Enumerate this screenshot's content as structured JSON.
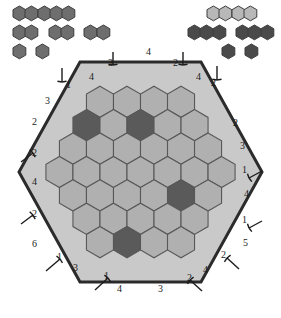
{
  "app": {
    "title": "Hexagon Logic Puzzle",
    "board_shape": "hexagon",
    "rows": 7
  },
  "colors": {
    "background": "#ffffff",
    "board_fill": "#c9c9c9",
    "board_border": "#2b2b2b",
    "cell_empty": "#b0b0b0",
    "cell_filled": "#5a5a5a",
    "cell_stroke": "#585858",
    "palette_light": "#b8b8b8",
    "palette_medium": "#6e6e6e",
    "palette_dark": "#4a4a4a",
    "clue_text": "#1c1c1c",
    "arrow": "#1c1c1c"
  },
  "palette": {
    "left": {
      "name": "left-piece-tray",
      "rows": [
        {
          "groups": [
            {
              "count": 5,
              "tone": "medium"
            }
          ]
        },
        {
          "groups": [
            {
              "count": 2,
              "tone": "medium"
            },
            {
              "count": 2,
              "tone": "medium"
            },
            {
              "count": 2,
              "tone": "medium"
            }
          ]
        },
        {
          "groups": [
            {
              "count": 1,
              "tone": "medium"
            },
            {
              "count": 1,
              "tone": "medium"
            }
          ]
        }
      ]
    },
    "right": {
      "name": "right-piece-tray",
      "rows": [
        {
          "groups": [
            {
              "count": 4,
              "tone": "light"
            }
          ]
        },
        {
          "groups": [
            {
              "count": 3,
              "tone": "dark"
            },
            {
              "count": 3,
              "tone": "dark"
            }
          ]
        },
        {
          "groups": [
            {
              "count": 1,
              "tone": "dark"
            },
            {
              "count": 1,
              "tone": "dark"
            }
          ]
        }
      ]
    }
  },
  "board": {
    "name": "hex-board",
    "row_lengths": [
      4,
      5,
      6,
      7,
      6,
      5,
      4
    ],
    "filled_cells": [
      {
        "row": 1,
        "col": 2,
        "label": "filled-cell-r1c2"
      },
      {
        "row": 1,
        "col": 0,
        "label": "filled-cell-r1c0"
      },
      {
        "row": 4,
        "col": 4,
        "label": "filled-cell-r4c4"
      },
      {
        "row": 6,
        "col": 1,
        "label": "filled-cell-r6c1"
      }
    ]
  },
  "clues": {
    "top": [
      {
        "text": "4",
        "arrow": "none"
      },
      {
        "text": "3",
        "arrow": "down"
      },
      {
        "text": "2",
        "arrow": "down"
      },
      {
        "text": "1",
        "arrow": "down"
      },
      {
        "text": "4",
        "arrow": "none"
      },
      {
        "text": "4",
        "arrow": "none"
      },
      {
        "text": "2",
        "arrow": "down"
      }
    ],
    "upper_left": [
      {
        "text": "3",
        "arrow": "none"
      },
      {
        "text": "2",
        "arrow": "none"
      }
    ],
    "left": [
      {
        "text": "2",
        "arrow": "up-right"
      },
      {
        "text": "4",
        "arrow": "none"
      },
      {
        "text": "2",
        "arrow": "up-right"
      },
      {
        "text": "6",
        "arrow": "none"
      }
    ],
    "upper_right": [
      {
        "text": "2",
        "arrow": "none"
      },
      {
        "text": "3",
        "arrow": "none"
      }
    ],
    "right": [
      {
        "text": "1",
        "arrow": "left"
      },
      {
        "text": "4",
        "arrow": "none"
      },
      {
        "text": "1",
        "arrow": "left"
      },
      {
        "text": "5",
        "arrow": "none"
      }
    ],
    "bottom_left": [
      {
        "text": "1",
        "arrow": "up-right"
      },
      {
        "text": "3",
        "arrow": "none"
      }
    ],
    "bottom": [
      {
        "text": "1",
        "arrow": "up-right"
      },
      {
        "text": "4",
        "arrow": "none"
      },
      {
        "text": "3",
        "arrow": "none"
      },
      {
        "text": "2",
        "arrow": "up-left"
      }
    ],
    "bottom_right": [
      {
        "text": "2",
        "arrow": "up-left"
      },
      {
        "text": "4",
        "arrow": "none"
      }
    ]
  }
}
